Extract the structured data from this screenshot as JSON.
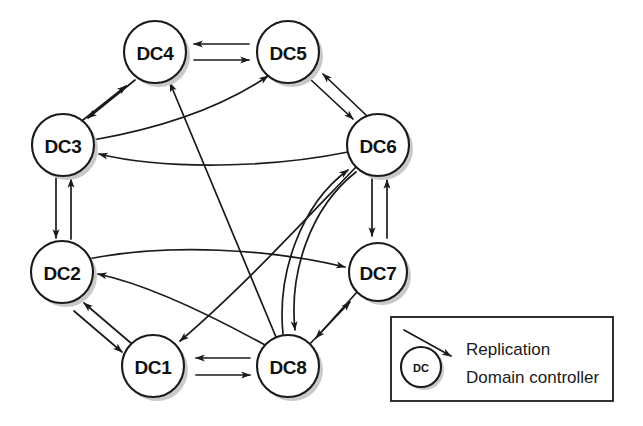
{
  "diagram": {
    "type": "node-link-diagram",
    "background_color": "#ffffff",
    "stroke_color": "#1a1a1a",
    "shadow_color": "#c9c9c9",
    "nodes": [
      {
        "id": "DC1",
        "label": "DC1",
        "cx": 153,
        "cy": 366,
        "r": 31
      },
      {
        "id": "DC2",
        "label": "DC2",
        "cx": 62,
        "cy": 272,
        "r": 31
      },
      {
        "id": "DC3",
        "label": "DC3",
        "cx": 63,
        "cy": 145,
        "r": 31
      },
      {
        "id": "DC4",
        "label": "DC4",
        "cx": 155,
        "cy": 52,
        "r": 31
      },
      {
        "id": "DC5",
        "label": "DC5",
        "cx": 288,
        "cy": 52,
        "r": 31
      },
      {
        "id": "DC6",
        "label": "DC6",
        "cx": 378,
        "cy": 145,
        "r": 31
      },
      {
        "id": "DC7",
        "label": "DC7",
        "cx": 378,
        "cy": 272,
        "r": 29
      },
      {
        "id": "DC8",
        "label": "DC8",
        "cx": 288,
        "cy": 366,
        "r": 31
      }
    ],
    "edges": [
      {
        "from": "DC4",
        "to": "DC5",
        "kind": "straight",
        "direction": "bidirectional"
      },
      {
        "from": "DC3",
        "to": "DC4",
        "kind": "straight",
        "direction": "bidirectional"
      },
      {
        "from": "DC5",
        "to": "DC6",
        "kind": "straight",
        "direction": "bidirectional"
      },
      {
        "from": "DC2",
        "to": "DC3",
        "kind": "straight",
        "direction": "bidirectional"
      },
      {
        "from": "DC6",
        "to": "DC7",
        "kind": "straight",
        "direction": "bidirectional"
      },
      {
        "from": "DC1",
        "to": "DC2",
        "kind": "straight",
        "direction": "bidirectional"
      },
      {
        "from": "DC1",
        "to": "DC8",
        "kind": "straight",
        "direction": "bidirectional"
      },
      {
        "from": "DC7",
        "to": "DC8",
        "kind": "straight",
        "direction": "bidirectional"
      },
      {
        "from": "DC3",
        "to": "DC5",
        "kind": "curved",
        "direction": "forward"
      },
      {
        "from": "DC6",
        "to": "DC3",
        "kind": "curved",
        "direction": "forward"
      },
      {
        "from": "DC2",
        "to": "DC7",
        "kind": "curved",
        "direction": "forward"
      },
      {
        "from": "DC8",
        "to": "DC2",
        "kind": "curved",
        "direction": "forward"
      },
      {
        "from": "DC8",
        "to": "DC4",
        "kind": "straight",
        "direction": "forward"
      },
      {
        "from": "DC6",
        "to": "DC1",
        "kind": "curved",
        "direction": "forward"
      },
      {
        "from": "DC8",
        "to": "DC6",
        "kind": "curved",
        "direction": "forward"
      },
      {
        "from": "DC6",
        "to": "DC8",
        "kind": "curved",
        "direction": "forward"
      }
    ]
  },
  "legend": {
    "box": {
      "x": 391,
      "y": 317,
      "width": 222,
      "height": 84
    },
    "items": [
      {
        "symbol": "arrow",
        "label": "Replication"
      },
      {
        "symbol": "circle",
        "circle_label": "DC",
        "label": "Domain controller"
      }
    ]
  }
}
